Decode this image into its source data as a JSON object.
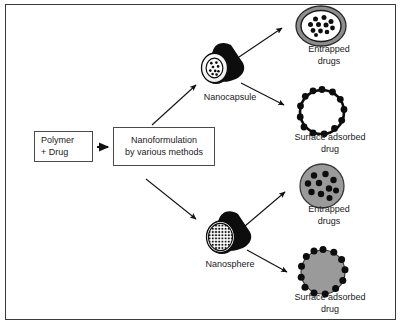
{
  "figure": {
    "border_color": "#3a3a3a",
    "background": "#ffffff"
  },
  "colors": {
    "ink": "#1a1a1a",
    "box_border": "#4a4a4a",
    "particle_black": "#0d0d0d",
    "particle_gray": "#9a9a9a",
    "shell_gray": "#8d8d8d",
    "white": "#ffffff"
  },
  "nodes": {
    "polymer_drug": {
      "line1": "Polymer",
      "line2": "+ Drug"
    },
    "nanoformulation": {
      "line1": "Nanoformulation",
      "line2": "by various methods"
    }
  },
  "particles": {
    "nanocapsule": {
      "label": "Nanocapsule",
      "shape": "capsule-teardrop",
      "face_fill": "#ffffff",
      "body_fill": "#0d0d0d",
      "core_dots": 9
    },
    "nanosphere": {
      "label": "Nanosphere",
      "shape": "sphere-teardrop",
      "face_fill": "#ffffff",
      "body_fill": "#0d0d0d",
      "mesh_dots": 45
    }
  },
  "outputs": [
    {
      "id": "entrapped-capsule",
      "line1": "Entrapped",
      "line2": "drugs",
      "shape": "ring-ellipse-hollow-core",
      "ring_fill": "#8d8d8d",
      "core_fill": "#ffffff",
      "dot_count": 11,
      "dot_fill": "#0d0d0d"
    },
    {
      "id": "surface-capsule",
      "line1": "Surface adsorbed",
      "line2": "drug",
      "shape": "ring-hollow-with-surface-dots",
      "ring_fill": "#ffffff",
      "ring_stroke": "#0d0d0d",
      "dot_count": 13,
      "dot_fill": "#0d0d0d"
    },
    {
      "id": "entrapped-sphere",
      "line1": "Entrapped",
      "line2": "drugs",
      "shape": "filled-circle-with-inner-dots",
      "fill": "#9a9a9a",
      "dot_count": 10,
      "dot_fill": "#0d0d0d"
    },
    {
      "id": "surface-sphere",
      "line1": "Surface adsorbed",
      "line2": "drug",
      "shape": "filled-circle-with-surface-dots",
      "fill": "#9a9a9a",
      "dot_count": 13,
      "dot_fill": "#0d0d0d"
    }
  ],
  "arrows": [
    {
      "id": "polymer-to-nanoformulation",
      "from": "polymer_drug",
      "to": "nanoformulation",
      "style": "short-thick"
    },
    {
      "id": "nanoformulation-to-nanocapsule",
      "from": "nanoformulation",
      "to": "nanocapsule",
      "style": "diagonal-up"
    },
    {
      "id": "nanoformulation-to-nanosphere",
      "from": "nanoformulation",
      "to": "nanosphere",
      "style": "diagonal-down"
    },
    {
      "id": "nanocapsule-to-entrapped",
      "from": "nanocapsule",
      "to": "entrapped-capsule",
      "style": "diagonal-up"
    },
    {
      "id": "nanocapsule-to-surface",
      "from": "nanocapsule",
      "to": "surface-capsule",
      "style": "diagonal-down"
    },
    {
      "id": "nanosphere-to-entrapped",
      "from": "nanosphere",
      "to": "entrapped-sphere",
      "style": "diagonal-up"
    },
    {
      "id": "nanosphere-to-surface",
      "from": "nanosphere",
      "to": "surface-sphere",
      "style": "diagonal-down"
    }
  ]
}
